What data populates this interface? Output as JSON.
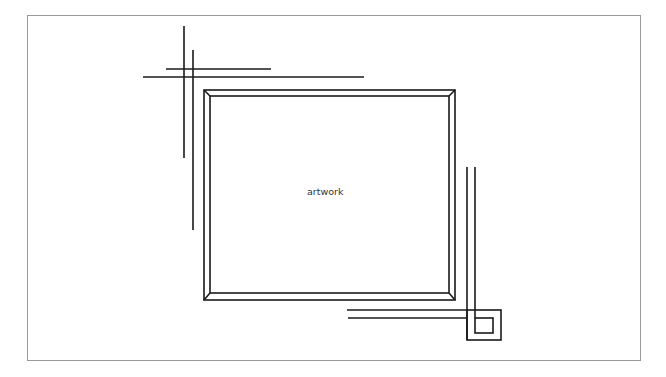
{
  "diagram": {
    "type": "framed artwork with crop marks",
    "center_label": "artwork",
    "colors": {
      "background": "#ffffff",
      "stroke": "#1a1a1a",
      "outer_border": "#9a9a9a",
      "text": "#333333"
    },
    "elements": [
      {
        "name": "outer-border",
        "description": "thin gray page border"
      },
      {
        "name": "picture-frame",
        "description": "rectangular frame with beveled corners (double outline)"
      },
      {
        "name": "crop-marks-top-left",
        "description": "two vertical and two horizontal crossing lines"
      },
      {
        "name": "crop-marks-bottom-right",
        "description": "two vertical and two horizontal lines meeting a small square-in-square"
      }
    ]
  }
}
